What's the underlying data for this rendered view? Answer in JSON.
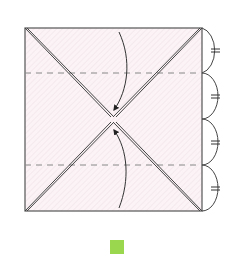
{
  "diagram": {
    "type": "origami-fold-diagram",
    "paper": {
      "shape": "square",
      "fill": "#fbf3f6",
      "hatch": "#ecdfe4",
      "edge_color": "#555555",
      "bounds": {
        "x": 25,
        "y": 28,
        "w": 177,
        "h": 183
      }
    },
    "creases": {
      "diagonals": "valley-fold-pair",
      "horizontal_dashed_y": [
        73,
        165
      ],
      "dashed_color": "#888888"
    },
    "arrows": [
      {
        "name": "fold-down-arrow",
        "from": "top-edge",
        "to": "center"
      },
      {
        "name": "fold-up-arrow",
        "from": "bottom-edge",
        "to": "center"
      }
    ],
    "equal_division": {
      "segments": 4,
      "marker": "double-tick",
      "side": "right"
    },
    "step_marker": {
      "color": "#9ad64e"
    }
  }
}
